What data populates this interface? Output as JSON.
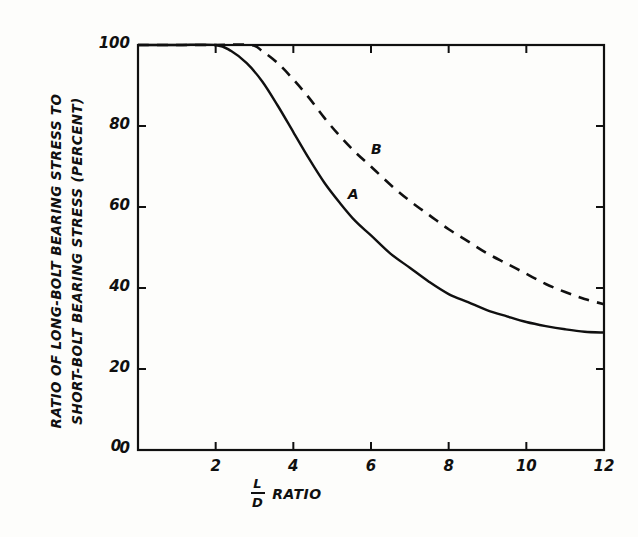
{
  "chart_data": {
    "type": "line",
    "title": "",
    "xlabel": "L/D RATIO",
    "xlabel_numerator": "L",
    "xlabel_denominator": "D",
    "xlabel_suffix": "RATIO",
    "ylabel_line1": "RATIO OF LONG-BOLT BEARING STRESS TO",
    "ylabel_line2": "SHORT-BOLT BEARING STRESS (PERCENT)",
    "xlim": [
      0,
      12
    ],
    "ylim": [
      0,
      100
    ],
    "xticks": [
      0,
      2,
      4,
      6,
      8,
      10,
      12
    ],
    "xtick_labels": [
      "0",
      "2",
      "4",
      "6",
      "8",
      "10",
      "12"
    ],
    "yticks": [
      0,
      20,
      40,
      60,
      80,
      100
    ],
    "ytick_labels": [
      "0",
      "20",
      "40",
      "60",
      "80",
      "100"
    ],
    "grid": false,
    "legend": "inline-curve-labels",
    "series": [
      {
        "name": "A",
        "label": "A",
        "style": "solid",
        "color": "#101010",
        "label_x": 5.4,
        "label_y": 63,
        "x": [
          0,
          1.0,
          2.0,
          2.4,
          2.8,
          3.2,
          3.6,
          4.0,
          4.4,
          4.8,
          5.2,
          5.6,
          6.0,
          6.5,
          7.0,
          7.5,
          8.0,
          8.5,
          9.0,
          9.5,
          10.0,
          10.5,
          11.0,
          11.5,
          12.0
        ],
        "y": [
          100,
          100,
          100,
          98.5,
          95.5,
          91.0,
          85.0,
          78.5,
          72.0,
          66.0,
          61.0,
          56.5,
          53.0,
          48.5,
          45.0,
          41.5,
          38.5,
          36.5,
          34.5,
          33.0,
          31.6,
          30.6,
          29.8,
          29.2,
          29.0
        ]
      },
      {
        "name": "B",
        "label": "B",
        "style": "dashed",
        "color": "#101010",
        "label_x": 6.0,
        "label_y": 74,
        "x": [
          0,
          1.0,
          2.0,
          2.9,
          3.2,
          3.6,
          4.0,
          4.4,
          4.8,
          5.2,
          5.6,
          6.0,
          6.5,
          7.0,
          7.5,
          8.0,
          8.5,
          9.0,
          9.5,
          10.0,
          10.5,
          11.0,
          11.5,
          12.0
        ],
        "y": [
          100,
          100,
          100,
          100,
          98.5,
          95.5,
          91.5,
          87.0,
          82.0,
          77.5,
          73.5,
          70.0,
          65.5,
          61.5,
          58.0,
          54.5,
          51.5,
          48.5,
          46.0,
          43.5,
          41.0,
          39.0,
          37.3,
          36.0
        ]
      }
    ]
  },
  "plot_geometry": {
    "left": 138,
    "right": 604,
    "top": 45,
    "bottom": 450
  }
}
